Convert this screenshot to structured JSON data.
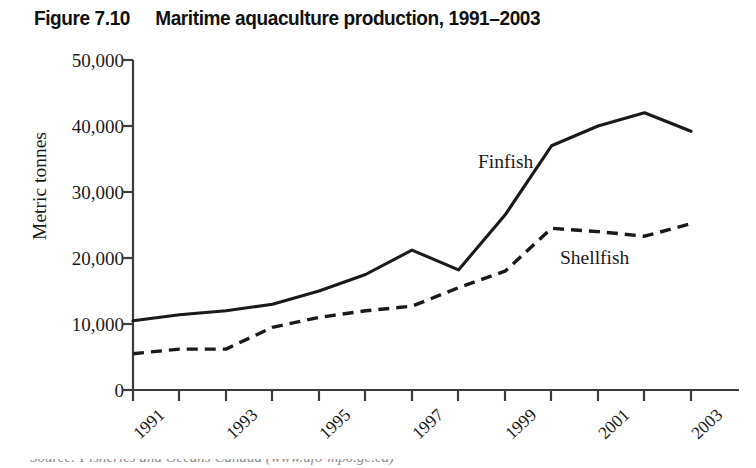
{
  "figure": {
    "label": "Figure 7.10",
    "title": "Maritime aquaculture production, 1991–2003"
  },
  "source_note": "Source: Fisheries and Oceans Canada (www.dfo-mpo.gc.ca)",
  "annotations": {
    "finfish": "Finfish",
    "shellfish": "Shellfish"
  },
  "colors": {
    "line": "#1a1a1a",
    "axis": "#4a4a4a",
    "background": "#ffffff"
  },
  "chart_data": {
    "type": "line",
    "title": "Maritime aquaculture production, 1991–2003",
    "xlabel": "",
    "ylabel": "Metric tonnes",
    "ylim": [
      0,
      50000
    ],
    "ytick_labels": [
      "50,000",
      "40,000",
      "30,000",
      "20,000",
      "10,000",
      "0"
    ],
    "ytick_values": [
      50000,
      40000,
      30000,
      20000,
      10000,
      0
    ],
    "grid": false,
    "legend": "inline-annotations",
    "x": [
      1991,
      1992,
      1993,
      1994,
      1995,
      1996,
      1997,
      1998,
      1999,
      2000,
      2001,
      2002,
      2003
    ],
    "xtick_labels": [
      "1991",
      "",
      "1993",
      "",
      "1995",
      "",
      "1997",
      "",
      "1999",
      "",
      "2001",
      "",
      "2003"
    ],
    "series": [
      {
        "name": "Finfish",
        "style": "solid",
        "values": [
          10500,
          11400,
          12000,
          13000,
          15000,
          17500,
          21200,
          18200,
          26500,
          37000,
          40000,
          42000,
          39200
        ]
      },
      {
        "name": "Shellfish",
        "style": "dashed",
        "values": [
          5500,
          6200,
          6200,
          9500,
          11000,
          12000,
          12700,
          15500,
          18000,
          24500,
          24000,
          23300,
          25200
        ]
      }
    ]
  }
}
